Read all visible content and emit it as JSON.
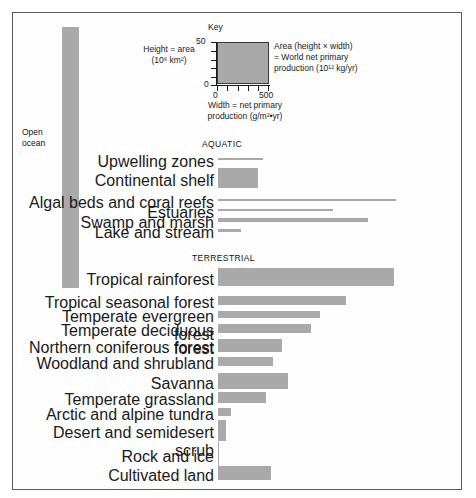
{
  "figure": {
    "key": {
      "title": "Key",
      "left_text_line1": "Height  =  area",
      "left_text_line2": "(10⁶ km²)",
      "right_text_line1": "Area (height  ×  width)",
      "right_text_line2": "=  World net primary",
      "right_text_line3": "production (10¹² kg/yr)",
      "bottom_text_line1": "Width  =  net primary",
      "bottom_text_line2": "production (g/m²•yr)",
      "y_axis_max_label": "50",
      "y_axis_min_label": "0",
      "x_axis_min_label": "0",
      "x_axis_max_label": "500"
    },
    "open_ocean": {
      "label_line1": "Open",
      "label_line2": "ocean"
    },
    "sections": {
      "aquatic_heading": "AQUATIC",
      "terrestrial_heading": "TERRESTRIAL"
    },
    "colors": {
      "bar_fill": "#a9a9a9",
      "frame_border": "#5c5c5c",
      "text": "#111111"
    }
  },
  "chart_data": {
    "type": "bar",
    "title": "Key",
    "xlabel": "Width = net primary production (g/m²•yr)",
    "ylabel": "Height = area (10⁶ km²)",
    "annotation": "Area (height × width) = World net primary production (10¹² kg/yr)",
    "grid": false,
    "legend": "none",
    "key_scale": {
      "height_ref": 50,
      "width_ref": 500,
      "height_units": "10^6 km2",
      "width_units": "g/m2*yr"
    },
    "groups": [
      {
        "name": "Open ocean",
        "categories": [
          "Open ocean"
        ],
        "bars": [
          {
            "label": "Open ocean",
            "npp_width": 125,
            "area_height": 332,
            "bar_px_width": 17,
            "bar_px_height": 261,
            "orientation": "vertical"
          }
        ]
      },
      {
        "name": "AQUATIC",
        "categories": [
          "Upwelling zones",
          "Continental shelf",
          "Algal beds and coral reefs",
          "Estuaries",
          "Swamp and marsh",
          "Lake and stream"
        ],
        "bars": [
          {
            "label": "Upwelling zones",
            "npp_width": 500,
            "area_height": 0.4,
            "bar_px_width": 45,
            "bar_px_height": 2
          },
          {
            "label": "Continental shelf",
            "npp_width": 360,
            "area_height": 26.6,
            "bar_px_width": 40,
            "bar_px_height": 20
          },
          {
            "label": "Algal beds and coral reefs",
            "npp_width": 2500,
            "area_height": 0.6,
            "bar_px_width": 178,
            "bar_px_height": 2
          },
          {
            "label": "Estuaries",
            "npp_width": 1500,
            "area_height": 1.4,
            "bar_px_width": 115,
            "bar_px_height": 2
          },
          {
            "label": "Swamp and marsh",
            "npp_width": 2000,
            "area_height": 2.0,
            "bar_px_width": 150,
            "bar_px_height": 4
          },
          {
            "label": "Lake and stream",
            "npp_width": 250,
            "area_height": 2.0,
            "bar_px_width": 23,
            "bar_px_height": 3
          }
        ]
      },
      {
        "name": "TERRESTRIAL",
        "categories": [
          "Tropical rainforest",
          "Tropical seasonal forest",
          "Temperate evergreen forest",
          "Temperate deciduous forest",
          "Northern coniferous forest",
          "Woodland and shrubland",
          "Savanna",
          "Temperate grassland",
          "Arctic and alpine tundra",
          "Desert and semidesert scrub",
          "Rock and ice",
          "Cultivated land"
        ],
        "bars": [
          {
            "label": "Tropical rainforest",
            "npp_width": 2200,
            "area_height": 17.0,
            "bar_px_width": 176,
            "bar_px_height": 18
          },
          {
            "label": "Tropical seasonal forest",
            "npp_width": 1600,
            "area_height": 7.5,
            "bar_px_width": 128,
            "bar_px_height": 9
          },
          {
            "label": "Temperate evergreen forest",
            "npp_width": 1300,
            "area_height": 5.0,
            "bar_px_width": 102,
            "bar_px_height": 7
          },
          {
            "label": "Temperate deciduous forest",
            "npp_width": 1200,
            "area_height": 7.0,
            "bar_px_width": 93,
            "bar_px_height": 9
          },
          {
            "label": "Northern coniferous forest",
            "npp_width": 800,
            "area_height": 12.0,
            "bar_px_width": 64,
            "bar_px_height": 13
          },
          {
            "label": "Woodland and shrubland",
            "npp_width": 700,
            "area_height": 8.5,
            "bar_px_width": 55,
            "bar_px_height": 9
          },
          {
            "label": "Savanna",
            "npp_width": 900,
            "area_height": 15.0,
            "bar_px_width": 70,
            "bar_px_height": 16
          },
          {
            "label": "Temperate grassland",
            "npp_width": 600,
            "area_height": 9.0,
            "bar_px_width": 48,
            "bar_px_height": 11
          },
          {
            "label": "Arctic and alpine tundra",
            "npp_width": 140,
            "area_height": 8.0,
            "bar_px_width": 13,
            "bar_px_height": 8
          },
          {
            "label": "Desert and semidesert scrub",
            "npp_width": 90,
            "area_height": 18.0,
            "bar_px_width": 8,
            "bar_px_height": 21
          },
          {
            "label": "Rock and ice",
            "npp_width": 3,
            "area_height": 24.0,
            "bar_px_width": 1,
            "bar_px_height": 24
          },
          {
            "label": "Cultivated land",
            "npp_width": 650,
            "area_height": 14.0,
            "bar_px_width": 53,
            "bar_px_height": 14
          }
        ]
      }
    ]
  }
}
